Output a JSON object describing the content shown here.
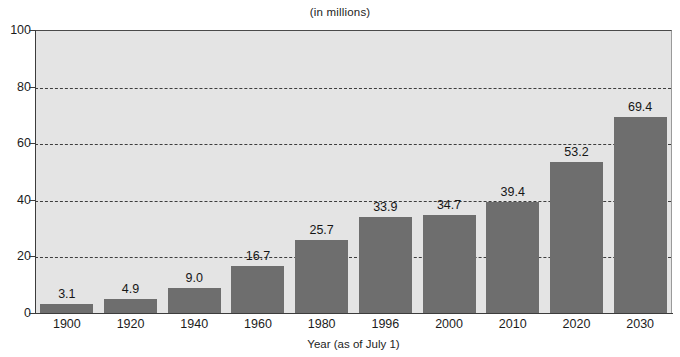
{
  "chart_data": {
    "type": "bar",
    "title": "(in millions)",
    "xlabel": "Year (as of July 1)",
    "ylabel": "",
    "ylim": [
      0,
      100
    ],
    "yticks": [
      0,
      20,
      40,
      60,
      80,
      100
    ],
    "ytick_labels": [
      "0",
      "20",
      "40",
      "60",
      "80",
      "100"
    ],
    "grid": "horizontal-dashed",
    "legend": "none",
    "categories": [
      "1900",
      "1920",
      "1940",
      "1960",
      "1980",
      "1996",
      "2000",
      "2010",
      "2020",
      "2030"
    ],
    "values": [
      3.1,
      4.9,
      9.0,
      16.7,
      25.7,
      33.9,
      34.7,
      39.4,
      53.2,
      69.4
    ],
    "value_labels": [
      "3.1",
      "4.9",
      "9.0",
      "16.7",
      "25.7",
      "33.9",
      "34.7",
      "39.4",
      "53.2",
      "69.4"
    ],
    "bar_color": "#6e6e6e",
    "plot_background": "#e4e4e4",
    "figure_background": "#ffffff",
    "axis_color": "#3c3c3c",
    "gridline_color": "#3d3d3d"
  }
}
